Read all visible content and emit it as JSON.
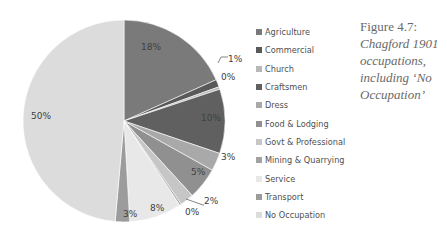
{
  "caption": {
    "figure": "Figure 4.7:",
    "lines": [
      "Chagford 1901",
      "occupations,",
      "including ‘No",
      "Occupation’"
    ]
  },
  "chart_data": {
    "type": "pie",
    "categories": [
      "Agriculture",
      "Commercial",
      "Church",
      "Craftsmen",
      "Dress",
      "Food & Lodging",
      "Govt & Professional",
      "Mining & Quarrying",
      "Service",
      "Transport",
      "No Occupation"
    ],
    "values": [
      18,
      1,
      0,
      10,
      3,
      5,
      2,
      0,
      8,
      3,
      50
    ],
    "value_labels": [
      "18%",
      "1%",
      "0%",
      "10%",
      "3%",
      "5%",
      "2%",
      "0%",
      "8%",
      "3%",
      "50%"
    ],
    "draw_values": [
      18.3,
      1.2,
      0.4,
      10.3,
      2.9,
      5.1,
      2.2,
      0.3,
      8.4,
      2.3,
      48.6
    ],
    "colors": [
      "#7a7a7a",
      "#595959",
      "#b8b8b8",
      "#606060",
      "#a9a9a9",
      "#909090",
      "#c6c6c6",
      "#a2a2a2",
      "#e8e8e8",
      "#9c9c9c",
      "#dcdcdc"
    ],
    "start_angle": "top, clockwise",
    "legend_position": "right",
    "label_positions": [
      {
        "x": 141,
        "y": 50,
        "leader": false
      },
      {
        "x": 228,
        "y": 62,
        "leader": true,
        "lx1": 218,
        "ly1": 63,
        "lx2": 221,
        "ly2": 57
      },
      {
        "x": 221,
        "y": 80,
        "leader": false
      },
      {
        "x": 201,
        "y": 121,
        "leader": false
      },
      {
        "x": 221,
        "y": 160,
        "leader": false
      },
      {
        "x": 191,
        "y": 175,
        "leader": false
      },
      {
        "x": 204,
        "y": 204,
        "leader": true,
        "lx1": 186,
        "ly1": 199,
        "lx2": 203,
        "ly2": 205
      },
      {
        "x": 185,
        "y": 215,
        "leader": false
      },
      {
        "x": 150,
        "y": 211,
        "leader": false
      },
      {
        "x": 123,
        "y": 217,
        "leader": false
      },
      {
        "x": 31,
        "y": 119,
        "leader": false
      }
    ]
  },
  "legend": {
    "items": [
      {
        "label": "Agriculture",
        "color": "#7a7a7a"
      },
      {
        "label": "Commercial",
        "color": "#595959"
      },
      {
        "label": "Church",
        "color": "#b8b8b8"
      },
      {
        "label": "Craftsmen",
        "color": "#606060"
      },
      {
        "label": "Dress",
        "color": "#a9a9a9"
      },
      {
        "label": "Food & Lodging",
        "color": "#909090"
      },
      {
        "label": "Govt & Professional",
        "color": "#c6c6c6"
      },
      {
        "label": "Mining & Quarrying",
        "color": "#a2a2a2"
      },
      {
        "label": "Service",
        "color": "#e8e8e8"
      },
      {
        "label": "Transport",
        "color": "#9c9c9c"
      },
      {
        "label": "No Occupation",
        "color": "#dcdcdc"
      }
    ]
  }
}
